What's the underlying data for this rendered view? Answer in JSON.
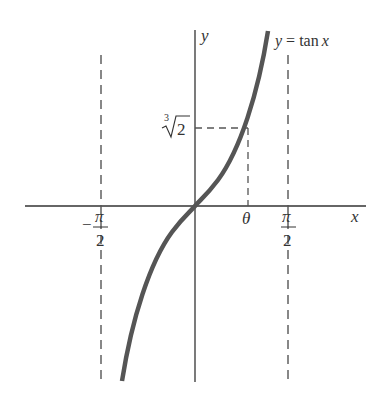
{
  "diagram": {
    "type": "function-graph",
    "function_label": "y = tan x",
    "function_label_parts": {
      "lhs": "y",
      "eq": " = ",
      "fn": "tan",
      "var": "x"
    },
    "axes": {
      "x_label": "x",
      "y_label": "y"
    },
    "x_ticks": [
      {
        "id": "neg-pi-over-2",
        "sign": "−",
        "numerator": "π",
        "denominator": "2"
      },
      {
        "id": "theta",
        "label": "θ"
      },
      {
        "id": "pi-over-2",
        "numerator": "π",
        "denominator": "2"
      }
    ],
    "y_marks": [
      {
        "id": "cube-root-2",
        "index": "3",
        "radicand": "2"
      }
    ],
    "asymptotes": [
      "x = −π/2",
      "x = π/2"
    ],
    "colors": {
      "curve": "#555555",
      "axes": "#333333",
      "dashes": "#555555",
      "text": "#333333"
    }
  }
}
